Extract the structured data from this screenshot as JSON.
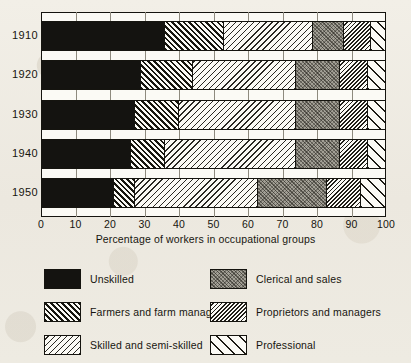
{
  "axis": {
    "caption": "Percentage of workers in occupational groups",
    "ticks": [
      "0",
      "10",
      "20",
      "30",
      "40",
      "50",
      "60",
      "70",
      "80",
      "90",
      "100"
    ],
    "min": 0,
    "max": 100
  },
  "years": [
    "1910",
    "1920",
    "1930",
    "1940",
    "1950"
  ],
  "legend": [
    {
      "key": "unskilled",
      "label": "Unskilled",
      "pattern": "solid-black"
    },
    {
      "key": "clerical",
      "label": "Clerical and sales",
      "pattern": "gray-stipple"
    },
    {
      "key": "farmers",
      "label": "Farmers and farm managers",
      "pattern": "dense-diagonal-up"
    },
    {
      "key": "proprietors",
      "label": "Proprietors and managers",
      "pattern": "dense-diagonal-down"
    },
    {
      "key": "skilled",
      "label": "Skilled and semi-skilled",
      "pattern": "sparse-diagonal-down"
    },
    {
      "key": "professional",
      "label": "Professional",
      "pattern": "wide-diagonal-up"
    }
  ],
  "chart_data": {
    "type": "bar",
    "orientation": "horizontal",
    "stacked": true,
    "title": "",
    "xlabel": "Percentage of workers in occupational groups",
    "ylabel": "",
    "xlim": [
      0,
      100
    ],
    "grid": true,
    "legend_position": "below",
    "categories": [
      "1910",
      "1920",
      "1930",
      "1940",
      "1950"
    ],
    "series": [
      {
        "name": "Unskilled",
        "key": "unskilled",
        "values": [
          36,
          29,
          27,
          26,
          21
        ]
      },
      {
        "name": "Farmers and farm managers",
        "key": "farmers",
        "values": [
          17,
          15,
          13,
          10,
          6
        ]
      },
      {
        "name": "Skilled and semi-skilled",
        "key": "skilled",
        "values": [
          26,
          30,
          34,
          38,
          36
        ]
      },
      {
        "name": "Clerical and sales",
        "key": "clerical",
        "values": [
          9,
          13,
          13,
          13,
          20
        ]
      },
      {
        "name": "Proprietors and managers",
        "key": "proprietors",
        "values": [
          8,
          8,
          8,
          8,
          10
        ]
      },
      {
        "name": "Professional",
        "key": "professional",
        "values": [
          4,
          5,
          5,
          5,
          7
        ]
      }
    ]
  }
}
